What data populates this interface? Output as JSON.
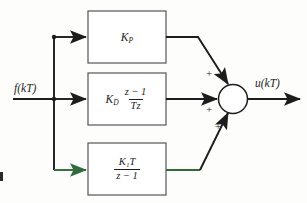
{
  "diagram": {
    "input_label": "f(kT)",
    "output_label": "u(kT)",
    "colors": {
      "line": "#1d1d1d",
      "integral_path": "#2f6b3d",
      "background": "#fdfdfc",
      "box_stroke": "#555555"
    },
    "blocks": [
      {
        "id": "proportional",
        "gain": "K",
        "gain_sub": "P",
        "numerator": "",
        "denominator": "",
        "has_fraction": false
      },
      {
        "id": "derivative",
        "gain": "K",
        "gain_sub": "D",
        "numerator": "z − 1",
        "denominator": "Tz",
        "has_fraction": true
      },
      {
        "id": "integral",
        "gain": "",
        "gain_sub": "",
        "numerator": "K₁T",
        "denominator": "z − 1",
        "has_fraction": true
      }
    ],
    "summing_junction": {
      "name": "summing-junction",
      "signs": [
        "+",
        "+",
        "+"
      ]
    }
  }
}
